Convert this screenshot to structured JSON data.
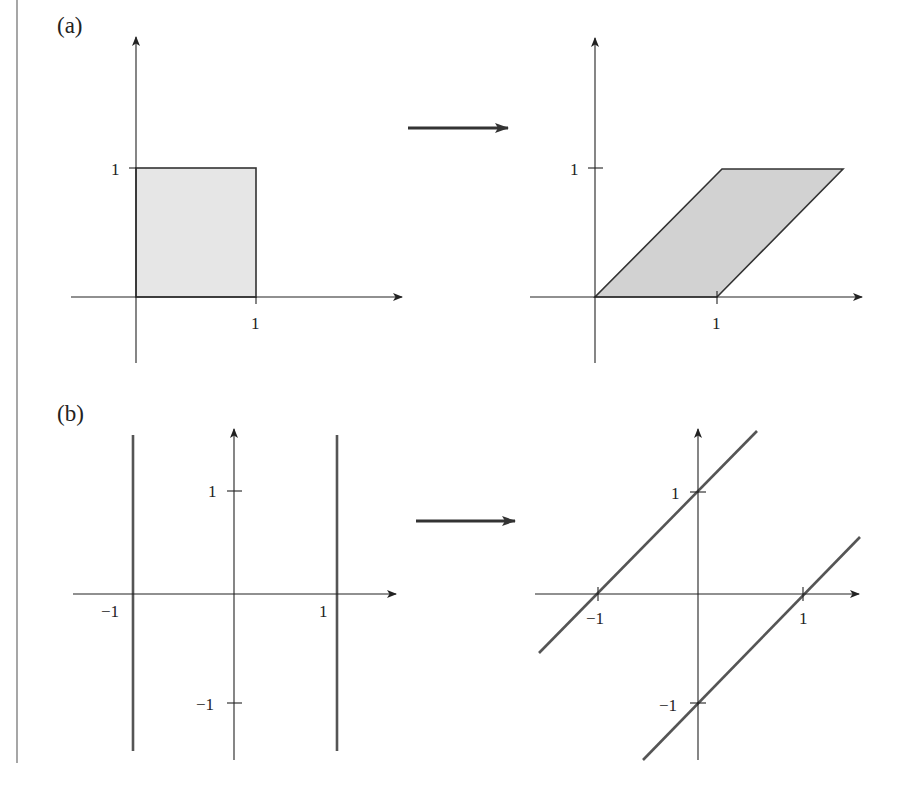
{
  "figure": {
    "panels": [
      {
        "label": "(a)",
        "description": "Shear transformation maps the unit square to a parallelogram",
        "before": {
          "shape": "unit square",
          "vertices": [
            [
              0,
              0
            ],
            [
              1,
              0
            ],
            [
              1,
              1
            ],
            [
              0,
              1
            ]
          ],
          "x_tick_label": "1",
          "y_tick_label": "1",
          "fill_color": "#e6e6e6"
        },
        "after": {
          "shape": "parallelogram",
          "vertices": [
            [
              0,
              0
            ],
            [
              1,
              0
            ],
            [
              2,
              1
            ],
            [
              1,
              1
            ]
          ],
          "x_tick_label": "1",
          "y_tick_label": "1",
          "fill_color": "#d2d2d2"
        }
      },
      {
        "label": "(b)",
        "description": "Vertical lines x = -1 and x = 1 map to slanted lines y = x + 1 and y = x - 1",
        "before": {
          "lines": [
            "x = -1",
            "x = 1"
          ],
          "x_tick_labels": [
            "−1",
            "1"
          ],
          "y_tick_labels": [
            "1",
            "−1"
          ]
        },
        "after": {
          "lines": [
            "y = x + 1",
            "y = x - 1"
          ],
          "x_tick_labels": [
            "−1",
            "1"
          ],
          "y_tick_labels": [
            "1",
            "−1"
          ]
        }
      }
    ],
    "colors": {
      "axis": "#222222",
      "line": "#555555",
      "outline": "#333333"
    }
  }
}
